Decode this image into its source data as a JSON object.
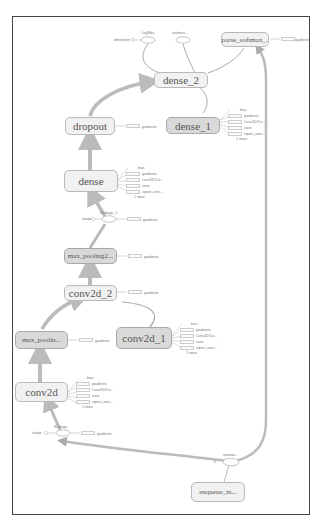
{
  "graph": {
    "nodes": {
      "sparse_softmax": "sparse_softmax_...",
      "dense_2": "dense_2",
      "dropout": "dropout",
      "dense_1": "dense_1",
      "dense": "dense",
      "max_pooling2": "max_pooling2...",
      "conv2d_2": "conv2d_2",
      "max_pooling": "max_poolin...",
      "conv2d_1": "conv2d_1",
      "conv2d": "conv2d",
      "enqueue": "enqueue_in..."
    },
    "ops": {
      "argmax": "ArgMax",
      "softmax": "softmax...",
      "reshape_1": "Reshape_1",
      "reshape": "Reshape",
      "random": "random..."
    },
    "small_labels": {
      "dimension": "dimension",
      "gradients": "gradients",
      "shape": "shape",
      "bias": "bias",
      "conv": "Conv2D/Conv...",
      "conv_short": "Conv2D/Co...",
      "save": "save",
      "report_uninit": "report_unin...",
      "more": "1 more",
      "random_port": "0"
    }
  }
}
